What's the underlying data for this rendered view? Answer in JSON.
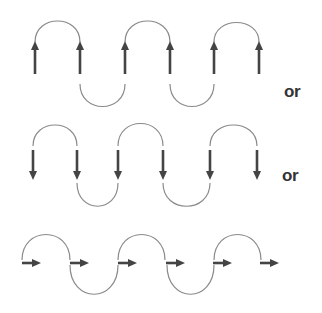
{
  "diagram": {
    "colors": {
      "arrow": "#444444",
      "arc": "#8a8a8a",
      "text": "#333333",
      "background": "#ffffff"
    },
    "rows": [
      {
        "id": "row-up",
        "arrow_direction": "up",
        "arrow_count": 6,
        "separator_label": "or"
      },
      {
        "id": "row-down",
        "arrow_direction": "down",
        "arrow_count": 6,
        "separator_label": "or"
      },
      {
        "id": "row-right",
        "arrow_direction": "right",
        "arrow_count": 6,
        "separator_label": ""
      }
    ]
  }
}
